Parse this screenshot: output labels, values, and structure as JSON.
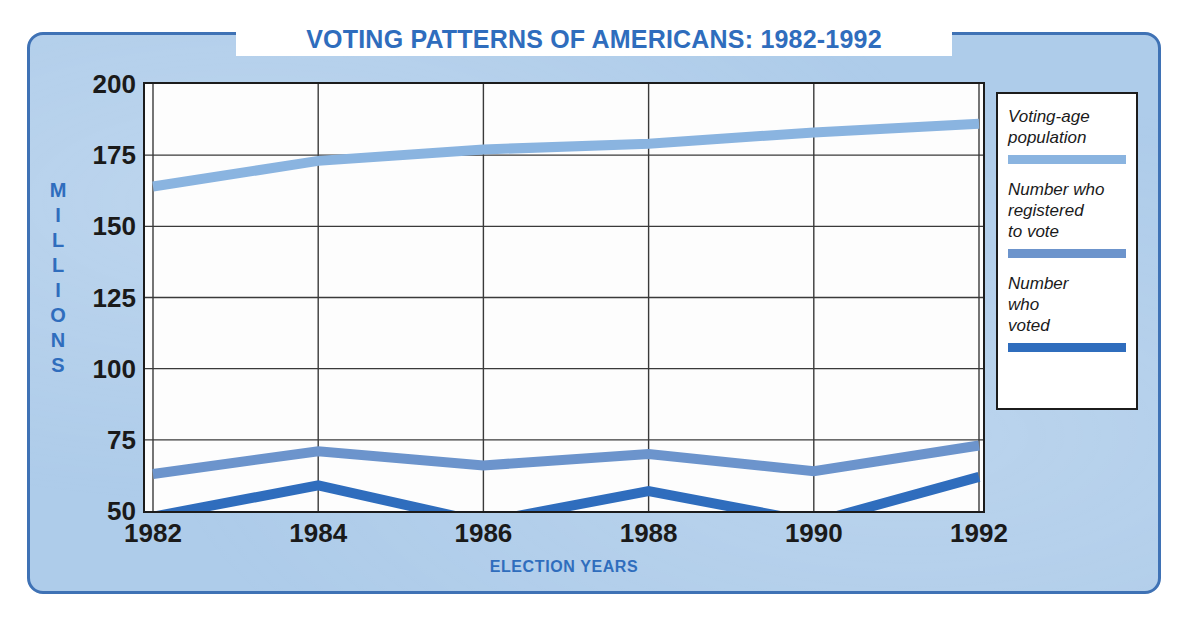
{
  "chart_data": {
    "type": "line",
    "title": "VOTING PATTERNS OF AMERICANS: 1982-1992",
    "xlabel": "ELECTION YEARS",
    "ylabel": "MILLIONS",
    "categories": [
      "1982",
      "1984",
      "1986",
      "1988",
      "1990",
      "1992"
    ],
    "x": [
      1982,
      1984,
      1986,
      1988,
      1990,
      1992
    ],
    "ylim": [
      50,
      200
    ],
    "yticks": [
      200,
      175,
      150,
      125,
      100,
      75,
      50
    ],
    "grid": true,
    "legend_position": "right",
    "series": [
      {
        "name": "Voting-age population",
        "color": "#8ab4e0",
        "values": [
          164,
          173,
          177,
          179,
          183,
          186
        ]
      },
      {
        "name": "Number who registered to vote",
        "color": "#6c94cc",
        "values": [
          63,
          71,
          66,
          70,
          64,
          73
        ]
      },
      {
        "name": "Number who voted",
        "color": "#2f6dbd",
        "values": [
          48,
          59,
          46,
          57,
          46,
          62
        ]
      }
    ]
  },
  "panel": {
    "border_color": "#3f72b5",
    "background_color": "#aeccea"
  },
  "title": {
    "text": "VOTING PATTERNS OF AMERICANS: 1982-1992",
    "color": "#2f6dbd"
  },
  "axes": {
    "y_title_letters": [
      "M",
      "I",
      "L",
      "L",
      "I",
      "O",
      "N",
      "S"
    ],
    "y_title": "MILLIONS",
    "y_ticks": [
      "200",
      "175",
      "150",
      "125",
      "100",
      "75",
      "50"
    ],
    "x_ticks": [
      "1982",
      "1984",
      "1986",
      "1988",
      "1990",
      "1992"
    ],
    "x_title": "ELECTION YEARS"
  },
  "legend": {
    "entries": [
      {
        "lines": [
          "Voting-age",
          "population"
        ],
        "line1": "Voting-age",
        "line2": "population",
        "line3": "",
        "color": "#8ab4e0"
      },
      {
        "lines": [
          "Number who",
          "registered",
          "to vote"
        ],
        "line1": "Number who",
        "line2": "registered",
        "line3": "to vote",
        "color": "#6c94cc"
      },
      {
        "lines": [
          "Number",
          "who",
          "voted"
        ],
        "line1": "Number",
        "line2": "who",
        "line3": "voted",
        "color": "#2f6dbd"
      }
    ]
  }
}
